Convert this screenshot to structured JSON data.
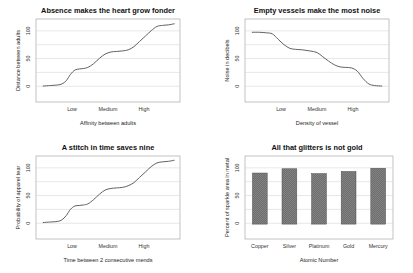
{
  "figure": {
    "background": "#ffffff",
    "line_color": "#5a5a5a",
    "bar_color": "#6e6e6e",
    "grid_color": "#c9c9c9",
    "frame_color": "#9a9a9a"
  },
  "charts": [
    {
      "id": "chart-absence",
      "chart_data": {
        "type": "line",
        "title": "Absence makes the heart grow fonder",
        "xlabel": "Affinity between adults",
        "ylabel": "Distance between adults",
        "xtick_labels": [
          "Low",
          "Medium",
          "High"
        ],
        "xtick_positions": [
          0.25,
          0.5,
          0.75
        ],
        "ytick_labels": [
          "0",
          "50",
          "100"
        ],
        "yticks": [
          0,
          50,
          100
        ],
        "ylim": [
          -28,
          128
        ],
        "xlim": [
          0,
          1
        ],
        "grid": true,
        "legend": "none",
        "x": [
          0.05,
          0.1,
          0.15,
          0.18,
          0.21,
          0.24,
          0.27,
          0.3,
          0.33,
          0.36,
          0.4,
          0.44,
          0.48,
          0.52,
          0.56,
          0.6,
          0.64,
          0.68,
          0.72,
          0.76,
          0.8,
          0.84,
          0.88,
          0.92,
          0.96
        ],
        "y": [
          2,
          3,
          4,
          6,
          12,
          24,
          32,
          34,
          35,
          37,
          44,
          54,
          62,
          66,
          67,
          68,
          70,
          76,
          86,
          96,
          106,
          114,
          116,
          117,
          119
        ]
      }
    },
    {
      "id": "chart-vessels",
      "chart_data": {
        "type": "line",
        "title": "Empty vessels make the most noise",
        "xlabel": "Density of vessel",
        "ylabel": "Noise in decibels",
        "xtick_labels": [
          "Low",
          "Medium",
          "High"
        ],
        "xtick_positions": [
          0.25,
          0.5,
          0.75
        ],
        "ytick_labels": [
          "0",
          "50",
          "100"
        ],
        "yticks": [
          0,
          50,
          100
        ],
        "ylim": [
          -28,
          128
        ],
        "xlim": [
          0,
          1
        ],
        "grid": true,
        "legend": "none",
        "x": [
          0.05,
          0.1,
          0.15,
          0.19,
          0.23,
          0.27,
          0.31,
          0.35,
          0.4,
          0.45,
          0.5,
          0.54,
          0.58,
          0.62,
          0.66,
          0.7,
          0.74,
          0.78,
          0.82,
          0.86,
          0.9,
          0.95
        ],
        "y": [
          103,
          103,
          102,
          100,
          90,
          80,
          73,
          71,
          70,
          68,
          65,
          57,
          49,
          42,
          38,
          37,
          36,
          30,
          16,
          6,
          3,
          2
        ]
      }
    },
    {
      "id": "chart-stitch",
      "chart_data": {
        "type": "line",
        "title": "A stitch in time saves nine",
        "xlabel": "Time between 2 consecutive mends",
        "ylabel": "Probability of apparel tear",
        "xtick_labels": [
          "Low",
          "Medium",
          "High"
        ],
        "xtick_positions": [
          0.25,
          0.5,
          0.75
        ],
        "ytick_labels": [
          "0",
          "50",
          "100"
        ],
        "yticks": [
          0,
          50,
          100
        ],
        "ylim": [
          -28,
          128
        ],
        "xlim": [
          0,
          1
        ],
        "grid": true,
        "legend": "none",
        "x": [
          0.05,
          0.1,
          0.15,
          0.18,
          0.21,
          0.24,
          0.27,
          0.3,
          0.33,
          0.36,
          0.4,
          0.44,
          0.48,
          0.52,
          0.56,
          0.6,
          0.64,
          0.68,
          0.72,
          0.76,
          0.8,
          0.84,
          0.88,
          0.92,
          0.96
        ],
        "y": [
          3,
          4,
          5,
          8,
          16,
          28,
          34,
          35,
          36,
          38,
          46,
          56,
          64,
          67,
          68,
          69,
          72,
          78,
          88,
          98,
          108,
          115,
          117,
          118,
          120
        ]
      }
    },
    {
      "id": "chart-glitters",
      "chart_data": {
        "type": "bar",
        "title": "All that glitters is not gold",
        "xlabel": "Atomic Number",
        "ylabel": "Percent of sparkle area in metal",
        "categories": [
          "Copper",
          "Silver",
          "Platinum",
          "Gold",
          "Mercury"
        ],
        "values": [
          96,
          104,
          95,
          99,
          105
        ],
        "ytick_labels": [
          "0",
          "50",
          "100"
        ],
        "yticks": [
          0,
          50,
          100
        ],
        "ylim": [
          -28,
          128
        ],
        "grid": true,
        "legend": "none"
      }
    }
  ]
}
